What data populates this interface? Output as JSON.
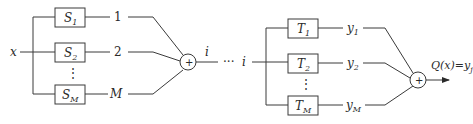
{
  "diagram": {
    "input_label": "x",
    "stage1": {
      "blocks": [
        {
          "name": "S",
          "sub": "1",
          "output": "1"
        },
        {
          "name": "S",
          "sub": "2",
          "output": "2"
        },
        {
          "name": "S",
          "sub": "M",
          "output": "M"
        }
      ],
      "ellipsis": "⋮",
      "sum_symbol": "+",
      "sum_output": "i"
    },
    "connector": {
      "dots": "···",
      "label": "i"
    },
    "stage2": {
      "blocks": [
        {
          "name": "T",
          "sub": "1",
          "output_var": "y",
          "output_sub": "1"
        },
        {
          "name": "T",
          "sub": "2",
          "output_var": "y",
          "output_sub": "2"
        },
        {
          "name": "T",
          "sub": "M",
          "output_var": "y",
          "output_sub": "M"
        }
      ],
      "ellipsis": "⋮",
      "sum_symbol": "+",
      "final_output": {
        "text": "Q(x)=y",
        "sub": "j"
      }
    }
  }
}
